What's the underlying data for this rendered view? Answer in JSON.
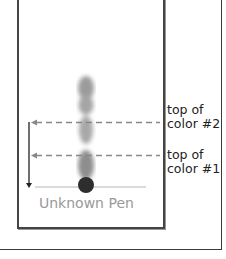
{
  "diagram": {
    "strip_label": "Unknown Pen",
    "markers": [
      {
        "label_line1": "top of",
        "label_line2": "color #2",
        "y": 122
      },
      {
        "label_line1": "top of",
        "label_line2": "color #1",
        "y": 155
      }
    ],
    "colors": {
      "ink_dot": "#2e2e2e",
      "ink_smear": "#8c8c8c",
      "dash": "#888888",
      "caption": "#9a9a9a",
      "border": "#444444"
    }
  }
}
